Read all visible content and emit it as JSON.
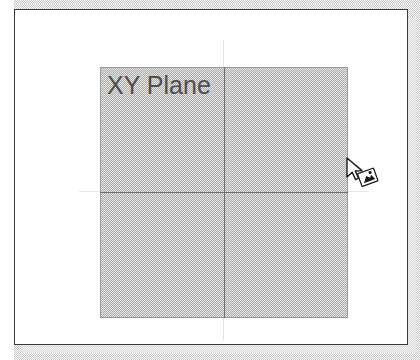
{
  "window": {
    "name": "xy-plane-viewport",
    "background_color": "#e9e9e9",
    "panel_color": "#ffffff",
    "border_color": "#3a3a3a"
  },
  "canvas": {
    "plane": {
      "label": "XY Plane",
      "fill_color": "#c6c6c6",
      "border_color": "#9a9a9a",
      "label_color": "#4f4f4f",
      "axis_color": "#6e6e6e"
    },
    "axes": {
      "vertical_name": "y-axis",
      "horizontal_name": "x-axis"
    }
  },
  "pointer": {
    "type": "drag-drop-cursor",
    "tooltip": ""
  }
}
